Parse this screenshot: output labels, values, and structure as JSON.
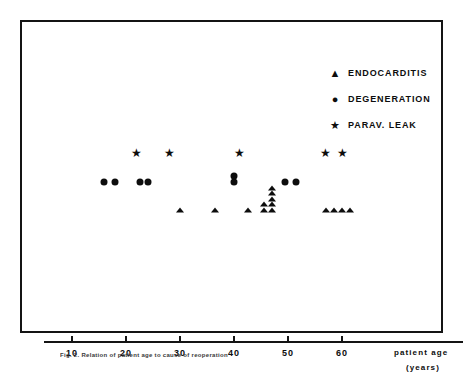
{
  "figure": {
    "caption": "Fig. 2.  Relation of patient age to cause of reoperation",
    "frame_color": "#141414",
    "marker_color": "#0d0d0d"
  },
  "legend": {
    "items": [
      {
        "glyph": "triangle",
        "glyph_char": "▲",
        "label": "ENDOCARDITIS"
      },
      {
        "glyph": "circle",
        "glyph_char": "●",
        "label": "DEGENERATION"
      },
      {
        "glyph": "star",
        "glyph_char": "★",
        "label": "PARAV. LEAK"
      }
    ]
  },
  "chart_data": {
    "type": "scatter",
    "title": "",
    "xlabel": "patient age",
    "xunits": "(years)",
    "ylabel": "",
    "grid": false,
    "legend_position": "top-right",
    "xlim": [
      0,
      70
    ],
    "xticks": [
      10,
      20,
      30,
      40,
      50,
      60
    ],
    "xtick_labels": [
      "10",
      "20",
      "30",
      "40",
      "50",
      "60"
    ],
    "series": [
      {
        "name": "ENDOCARDITIS",
        "marker": "triangle",
        "points": [
          {
            "age": 30,
            "row": 0
          },
          {
            "age": 36.5,
            "row": 0
          },
          {
            "age": 42.5,
            "row": 0
          },
          {
            "age": 45.5,
            "row": 0
          },
          {
            "age": 45.5,
            "row": 1
          },
          {
            "age": 47,
            "row": 0
          },
          {
            "age": 47,
            "row": 1
          },
          {
            "age": 47,
            "row": 2
          },
          {
            "age": 47,
            "row": 3
          },
          {
            "age": 47,
            "row": 4
          },
          {
            "age": 57,
            "row": 0
          },
          {
            "age": 58.5,
            "row": 0
          },
          {
            "age": 60,
            "row": 0
          },
          {
            "age": 61.5,
            "row": 0
          }
        ]
      },
      {
        "name": "DEGENERATION",
        "marker": "circle",
        "points": [
          {
            "age": 16,
            "row": 0
          },
          {
            "age": 18,
            "row": 0
          },
          {
            "age": 22.5,
            "row": 0
          },
          {
            "age": 24,
            "row": 0
          },
          {
            "age": 40,
            "row": 0
          },
          {
            "age": 40,
            "row": 1
          },
          {
            "age": 49.5,
            "row": 0
          },
          {
            "age": 51.5,
            "row": 0
          }
        ]
      },
      {
        "name": "PARAV. LEAK",
        "marker": "star",
        "points": [
          {
            "age": 22,
            "row": 0
          },
          {
            "age": 28,
            "row": 0
          },
          {
            "age": 41,
            "row": 0
          },
          {
            "age": 57,
            "row": 0
          },
          {
            "age": 60,
            "row": 0
          }
        ]
      }
    ]
  }
}
